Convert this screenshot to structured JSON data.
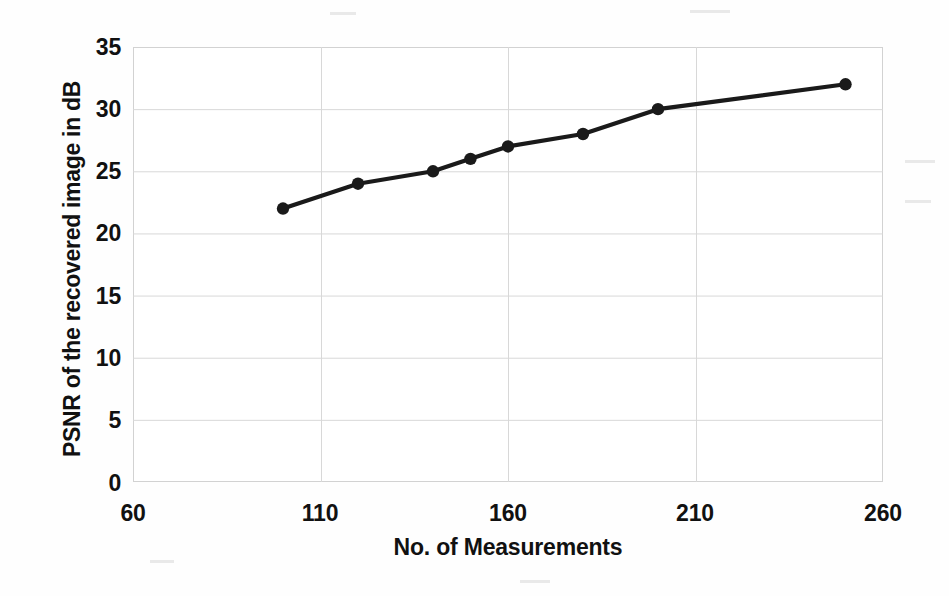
{
  "chart_data": {
    "type": "line",
    "title": "",
    "xlabel": "No. of Measurements",
    "ylabel": "PSNR of the recovered image in dB",
    "xlim": [
      60,
      260
    ],
    "ylim": [
      0,
      35
    ],
    "xticks": [
      60,
      110,
      160,
      210,
      260
    ],
    "yticks": [
      0,
      5,
      10,
      15,
      20,
      25,
      30,
      35
    ],
    "grid": true,
    "legend": null,
    "legend_position": "none",
    "marker": "circle",
    "line_color": "#1a1a1a",
    "marker_color": "#1a1a1a",
    "grid_color": "#d8d8d8",
    "series": [
      {
        "name": "PSNR",
        "x": [
          100,
          120,
          140,
          150,
          160,
          180,
          200,
          250
        ],
        "values": [
          22,
          24,
          25,
          26,
          27,
          28,
          30,
          32
        ]
      }
    ]
  },
  "axes": {
    "y_title": "PSNR of the recovered image in dB",
    "x_title": "No. of Measurements",
    "y_tick_labels": [
      "35",
      "30",
      "25",
      "20",
      "15",
      "10",
      "5",
      "0"
    ],
    "x_tick_labels": [
      "60",
      "110",
      "160",
      "210",
      "260"
    ]
  }
}
